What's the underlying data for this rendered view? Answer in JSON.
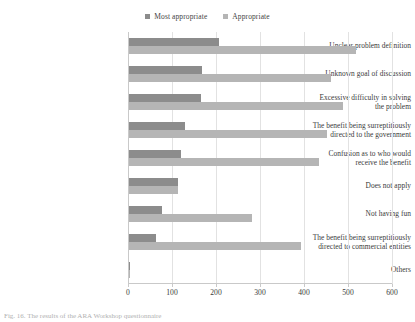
{
  "chart_data": {
    "type": "bar",
    "orientation": "horizontal",
    "title": "",
    "xlabel": "",
    "ylabel": "",
    "xlim": [
      0,
      600
    ],
    "xticks": [
      0,
      100,
      200,
      300,
      400,
      500,
      600
    ],
    "grid": true,
    "legend_position": "top-center",
    "categories": [
      "Unclear problem definition",
      "Unknown goal of discussion",
      "Excessive difficulty in solving the problem",
      "The benefit being surreptitiously directed to the government",
      "Confusion as to who would receive the benefit",
      "Does not apply",
      "Not having fun",
      "The benefit being surreptitiously directed to commercial entities",
      "Others"
    ],
    "category_lines": [
      [
        "Unclear problem definition"
      ],
      [
        "Unknown goal of discussion"
      ],
      [
        "Excessive difficulty in solving",
        "the problem"
      ],
      [
        "The benefit being surreptitiously",
        "directed to the government"
      ],
      [
        "Confusion as to who would",
        "receive the benefit"
      ],
      [
        "Does not apply"
      ],
      [
        "Not having fun"
      ],
      [
        "The benefit being surreptitiously",
        "directed to commercial entities"
      ],
      [
        "Others"
      ]
    ],
    "series": [
      {
        "name": "Most appropriate",
        "color": "#8c8c8c",
        "values": [
          205,
          165,
          163,
          128,
          118,
          112,
          75,
          62,
          2
        ]
      },
      {
        "name": "Appropriate",
        "color": "#b5b5b5",
        "values": [
          515,
          458,
          487,
          450,
          432,
          112,
          280,
          390,
          2
        ]
      }
    ]
  },
  "legend": {
    "entries": [
      {
        "label": "Most appropriate",
        "color": "#8c8c8c"
      },
      {
        "label": "Appropriate",
        "color": "#b5b5b5"
      }
    ]
  },
  "caption": {
    "text": "Fig. 16.  The results of the ARA Workshop questionnaire"
  }
}
